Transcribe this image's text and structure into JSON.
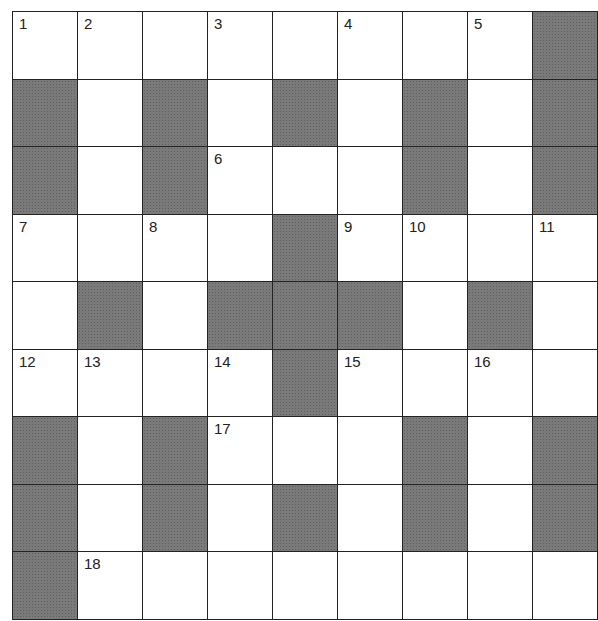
{
  "puzzle": {
    "rows": 9,
    "cols": 9,
    "colors": {
      "block": "#7a7a7a",
      "cell": "#ffffff",
      "line": "#222222"
    },
    "grid": [
      [
        "1",
        "2",
        "",
        "3",
        "",
        "4",
        "",
        "5",
        "#"
      ],
      [
        "#",
        "",
        "#",
        "",
        "#",
        "",
        "#",
        "",
        "#"
      ],
      [
        "#",
        "",
        "#",
        "6",
        "",
        "",
        "#",
        "",
        "#"
      ],
      [
        "7",
        "",
        "8",
        "",
        "#",
        "9",
        "10",
        "",
        "11"
      ],
      [
        "",
        "#",
        "",
        "#",
        "#",
        "#",
        "",
        "#",
        ""
      ],
      [
        "12",
        "13",
        "",
        "14",
        "#",
        "15",
        "",
        "16",
        ""
      ],
      [
        "#",
        "",
        "#",
        "17",
        "",
        "",
        "#",
        "",
        "#"
      ],
      [
        "#",
        "",
        "#",
        "",
        "#",
        "",
        "#",
        "",
        "#"
      ],
      [
        "#",
        "18",
        "",
        "",
        "",
        "",
        "",
        "",
        ""
      ]
    ]
  }
}
